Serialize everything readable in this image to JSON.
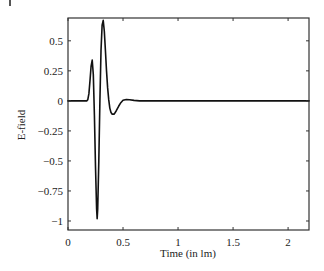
{
  "chart_data": {
    "type": "line",
    "title": "",
    "xlabel": "Time (in lm)",
    "ylabel": "E-field",
    "xlim": [
      0,
      2.19
    ],
    "ylim": [
      -1.075,
      0.69
    ],
    "grid": false,
    "legend": null,
    "x_ticks": [
      0,
      0.5,
      1,
      1.5,
      2
    ],
    "x_tick_labels": [
      "0",
      "0.5",
      "1",
      "1.5",
      "2"
    ],
    "y_ticks": [
      0.5,
      0.25,
      0,
      -0.25,
      -0.5,
      -0.75,
      -1
    ],
    "y_tick_labels": [
      "0.5",
      "0.25",
      "0",
      "−0.25",
      "−0.5",
      "−0.75",
      "−1"
    ],
    "series": [
      {
        "name": "E-field",
        "color": "#111111",
        "x": [
          0,
          0.17,
          0.18,
          0.19,
          0.2,
          0.21,
          0.22,
          0.23,
          0.24,
          0.25,
          0.26,
          0.265,
          0.27,
          0.28,
          0.29,
          0.3,
          0.31,
          0.32,
          0.33,
          0.34,
          0.35,
          0.36,
          0.37,
          0.38,
          0.39,
          0.4,
          0.42,
          0.44,
          0.46,
          0.48,
          0.5,
          0.53,
          0.56,
          0.6,
          0.65,
          0.7,
          1.0,
          1.5,
          2.0,
          2.19
        ],
        "y": [
          0,
          0,
          0.01,
          0.06,
          0.17,
          0.29,
          0.34,
          0.22,
          -0.12,
          -0.55,
          -0.9,
          -0.98,
          -0.9,
          -0.5,
          0.0,
          0.42,
          0.63,
          0.67,
          0.58,
          0.42,
          0.25,
          0.11,
          0.01,
          -0.06,
          -0.095,
          -0.11,
          -0.11,
          -0.08,
          -0.045,
          -0.015,
          0.005,
          0.012,
          0.01,
          0.004,
          0.0,
          0,
          0,
          0,
          0,
          0
        ]
      }
    ]
  }
}
